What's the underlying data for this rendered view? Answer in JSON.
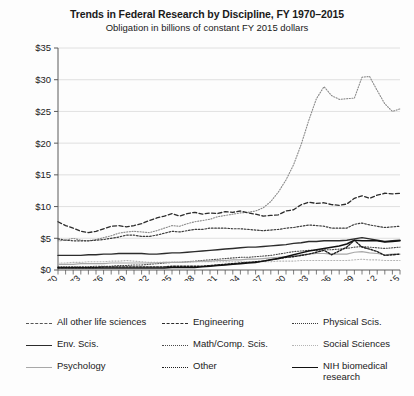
{
  "chart_data": {
    "type": "line",
    "title": "Trends in Federal Research by Discipline, FY 1970–2015",
    "subtitle": "Obligation in billions of constant FY 2015 dollars",
    "xlabel": "",
    "ylabel": "",
    "ylim": [
      0,
      35
    ],
    "ytick_values": [
      0,
      5,
      10,
      15,
      20,
      25,
      30,
      35
    ],
    "ytick_labels": [
      "$0",
      "$5",
      "$10",
      "$15",
      "$20",
      "$25",
      "$30",
      "$35"
    ],
    "grid": true,
    "legend_position": "below",
    "xlim": [
      1970,
      2015
    ],
    "x": [
      1970,
      1971,
      1972,
      1973,
      1974,
      1975,
      1976,
      1977,
      1978,
      1979,
      1980,
      1981,
      1982,
      1983,
      1984,
      1985,
      1986,
      1987,
      1988,
      1989,
      1990,
      1991,
      1992,
      1993,
      1994,
      1995,
      1996,
      1997,
      1998,
      1999,
      2000,
      2001,
      2002,
      2003,
      2004,
      2005,
      2006,
      2007,
      2008,
      2009,
      2010,
      2011,
      2012,
      2013,
      2014,
      2015
    ],
    "xtick_values": [
      1970,
      1973,
      1976,
      1979,
      1982,
      1985,
      1988,
      1991,
      1994,
      1997,
      2000,
      2003,
      2006,
      2009,
      2012,
      2015
    ],
    "xtick_labels": [
      "1970",
      "1973",
      "1976",
      "1979",
      "1982",
      "1985",
      "1988",
      "1991",
      "1994",
      "1997",
      "2000",
      "2003",
      "2006",
      "2009",
      "2012",
      "2015"
    ],
    "series": [
      {
        "name": "All other life sciences",
        "style": "dotted-fine",
        "color": "#8a8a8a",
        "width": 1.1,
        "values": [
          4.6,
          4.7,
          5.0,
          4.7,
          4.6,
          4.8,
          5.1,
          5.4,
          5.8,
          6.0,
          6.1,
          6.0,
          5.9,
          6.2,
          6.6,
          7.0,
          6.9,
          7.3,
          7.6,
          7.8,
          8.0,
          8.4,
          8.6,
          8.8,
          9.0,
          9.1,
          9.3,
          9.8,
          10.8,
          12.3,
          14.2,
          16.6,
          19.8,
          23.6,
          27.0,
          28.9,
          27.5,
          26.9,
          27.0,
          27.1,
          30.4,
          30.5,
          28.3,
          26.2,
          25.0,
          25.4
        ]
      },
      {
        "name": "Engineering",
        "style": "dashed",
        "color": "#2c2c2c",
        "width": 1.3,
        "values": [
          7.6,
          7.0,
          6.6,
          6.1,
          5.9,
          6.1,
          6.5,
          6.9,
          7.0,
          6.8,
          7.0,
          7.3,
          7.8,
          8.2,
          8.5,
          8.9,
          8.5,
          8.9,
          9.1,
          8.8,
          9.0,
          8.9,
          9.2,
          9.1,
          9.3,
          9.0,
          8.8,
          8.5,
          8.6,
          8.7,
          9.3,
          9.5,
          10.3,
          10.7,
          10.5,
          10.6,
          10.3,
          10.2,
          10.4,
          11.3,
          11.7,
          11.3,
          11.8,
          12.1,
          12.0,
          12.1
        ]
      },
      {
        "name": "Physical Scis.",
        "style": "dotted",
        "color": "#3b3b3b",
        "width": 1.2,
        "values": [
          4.9,
          4.7,
          4.6,
          4.6,
          4.6,
          4.7,
          4.8,
          5.0,
          5.2,
          5.5,
          5.5,
          5.3,
          5.3,
          5.5,
          5.8,
          6.1,
          6.0,
          6.2,
          6.4,
          6.4,
          6.6,
          6.6,
          6.6,
          6.5,
          6.5,
          6.4,
          6.3,
          6.2,
          6.3,
          6.4,
          6.6,
          6.7,
          6.9,
          7.1,
          7.0,
          6.9,
          6.6,
          6.6,
          6.6,
          7.2,
          7.4,
          7.1,
          6.9,
          6.7,
          6.8,
          6.9
        ]
      },
      {
        "name": "Env. Scis.",
        "style": "solid",
        "color": "#2c2c2c",
        "width": 1.4,
        "values": [
          2.3,
          2.3,
          2.3,
          2.3,
          2.4,
          2.4,
          2.5,
          2.5,
          2.6,
          2.6,
          2.6,
          2.6,
          2.5,
          2.5,
          2.6,
          2.7,
          2.7,
          2.8,
          2.9,
          3.0,
          3.1,
          3.2,
          3.3,
          3.4,
          3.5,
          3.6,
          3.6,
          3.7,
          3.8,
          3.9,
          4.0,
          4.2,
          4.3,
          4.5,
          4.5,
          4.6,
          4.6,
          4.6,
          4.7,
          4.9,
          5.1,
          4.9,
          4.7,
          4.5,
          4.6,
          4.7
        ]
      },
      {
        "name": "Math/Comp. Scis.",
        "style": "dotted-fine",
        "color": "#4a4a4a",
        "width": 1.1,
        "values": [
          0.5,
          0.5,
          0.5,
          0.5,
          0.5,
          0.6,
          0.6,
          0.6,
          0.7,
          0.7,
          0.8,
          0.8,
          0.9,
          1.0,
          1.1,
          1.2,
          1.2,
          1.3,
          1.4,
          1.5,
          1.6,
          1.7,
          1.8,
          1.9,
          2.0,
          2.0,
          2.1,
          2.2,
          2.3,
          2.5,
          2.7,
          2.9,
          3.0,
          3.1,
          3.1,
          3.2,
          3.2,
          3.3,
          3.4,
          3.6,
          3.7,
          3.6,
          3.5,
          3.4,
          3.5,
          3.6
        ]
      },
      {
        "name": "Social Sciences",
        "style": "dotted-light",
        "color": "#b4b4b4",
        "width": 1.1,
        "values": [
          1.1,
          1.1,
          1.2,
          1.2,
          1.3,
          1.3,
          1.3,
          1.4,
          1.4,
          1.5,
          1.4,
          1.3,
          1.2,
          1.2,
          1.2,
          1.2,
          1.2,
          1.2,
          1.3,
          1.3,
          1.3,
          1.3,
          1.3,
          1.3,
          1.3,
          1.3,
          1.3,
          1.3,
          1.3,
          1.4,
          1.4,
          1.4,
          1.5,
          1.5,
          1.5,
          1.5,
          1.5,
          1.5,
          1.5,
          1.6,
          1.7,
          1.6,
          1.6,
          1.5,
          1.5,
          1.5
        ]
      },
      {
        "name": "Psychology",
        "style": "solid-light",
        "color": "#a8a8a8",
        "width": 1.2,
        "values": [
          0.9,
          0.9,
          0.9,
          1.0,
          1.0,
          1.0,
          1.0,
          1.1,
          1.1,
          1.1,
          1.1,
          1.1,
          1.1,
          1.1,
          1.2,
          1.2,
          1.2,
          1.3,
          1.3,
          1.4,
          1.4,
          1.5,
          1.5,
          1.6,
          1.6,
          1.7,
          1.7,
          1.8,
          1.9,
          2.0,
          2.1,
          2.2,
          2.4,
          2.5,
          2.6,
          2.6,
          2.5,
          2.5,
          2.5,
          2.8,
          2.9,
          2.7,
          2.6,
          2.4,
          2.5,
          2.5
        ]
      },
      {
        "name": "Other",
        "style": "dotted-heavy",
        "color": "#1f1f1f",
        "width": 1.4,
        "values": [
          0.4,
          0.4,
          0.4,
          0.4,
          0.4,
          0.4,
          0.5,
          0.5,
          0.5,
          0.5,
          0.5,
          0.5,
          0.5,
          0.5,
          0.5,
          0.6,
          0.6,
          0.6,
          0.6,
          0.6,
          0.7,
          0.8,
          0.9,
          1.0,
          1.1,
          1.2,
          1.3,
          1.4,
          1.6,
          1.8,
          2.0,
          2.1,
          2.3,
          2.5,
          2.8,
          3.1,
          2.4,
          3.0,
          3.6,
          4.7,
          3.6,
          3.3,
          2.9,
          2.3,
          2.4,
          2.5
        ]
      },
      {
        "name": "NIH biomedical research",
        "style": "solid",
        "color": "#111111",
        "width": 1.5,
        "values": [
          0.3,
          0.3,
          0.3,
          0.3,
          0.3,
          0.3,
          0.3,
          0.3,
          0.3,
          0.3,
          0.3,
          0.3,
          0.3,
          0.3,
          0.3,
          0.4,
          0.4,
          0.4,
          0.4,
          0.5,
          0.6,
          0.7,
          0.8,
          0.9,
          1.0,
          1.1,
          1.2,
          1.4,
          1.6,
          1.8,
          2.1,
          2.4,
          2.7,
          3.0,
          3.2,
          3.4,
          3.6,
          3.8,
          4.1,
          4.7,
          4.6,
          4.6,
          4.6,
          4.4,
          4.5,
          4.6
        ]
      }
    ]
  },
  "legend": {
    "columns": [
      [
        {
          "label": "All other life sciences",
          "style": "dashed",
          "color": "#555555"
        },
        {
          "label": "Env. Scis.",
          "style": "solid",
          "color": "#2c2c2c"
        },
        {
          "label": "Psychology",
          "style": "solid-light",
          "color": "#a8a8a8"
        }
      ],
      [
        {
          "label": "Engineering",
          "style": "dashed",
          "color": "#2c2c2c"
        },
        {
          "label": "Math/Comp. Scis.",
          "style": "dotted-fine",
          "color": "#4a4a4a"
        },
        {
          "label": "Other",
          "style": "dotted-heavy",
          "color": "#1f1f1f"
        }
      ],
      [
        {
          "label": "Physical Scis.",
          "style": "dotted",
          "color": "#3b3b3b"
        },
        {
          "label": "Social Sciences",
          "style": "dotted-light",
          "color": "#b4b4b4"
        },
        {
          "label": "NIH biomedical research",
          "style": "solid",
          "color": "#111111"
        }
      ]
    ]
  },
  "colors": {
    "background": "#fdfdfd",
    "axis": "#5a5a5a",
    "grid": "#d8d8d8",
    "text": "#1a1a1a"
  }
}
